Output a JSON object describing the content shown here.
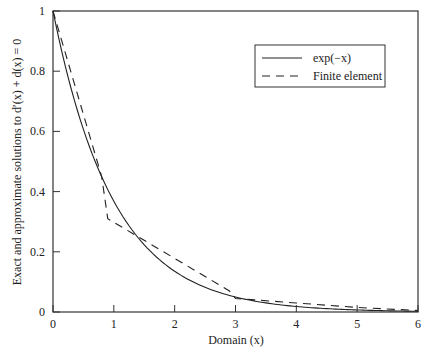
{
  "chart_data": {
    "type": "line",
    "title": "",
    "xlabel": "Domain (x)",
    "ylabel": "Exact and approximate solutions to d'(x) + d(x) = 0",
    "xlim": [
      0,
      6
    ],
    "ylim": [
      0,
      1
    ],
    "x_ticks": [
      "0",
      "1",
      "2",
      "3",
      "4",
      "5",
      "6"
    ],
    "y_ticks": [
      "0",
      "0.2",
      "0.4",
      "0.6",
      "0.8",
      "1"
    ],
    "grid": false,
    "legend_position": "upper right",
    "series": [
      {
        "name": "exp(−x)",
        "style": "solid",
        "x": [
          0,
          0.25,
          0.5,
          0.75,
          1,
          1.5,
          2,
          2.5,
          3,
          3.5,
          4,
          4.5,
          5,
          5.5,
          6
        ],
        "y": [
          1,
          0.779,
          0.607,
          0.472,
          0.368,
          0.223,
          0.135,
          0.082,
          0.05,
          0.03,
          0.018,
          0.011,
          0.007,
          0.004,
          0.002
        ]
      },
      {
        "name": "Finite element",
        "style": "dashed",
        "x": [
          0,
          0.8,
          0.9,
          2.9,
          3.0,
          4,
          5,
          6
        ],
        "y": [
          1,
          0.45,
          0.31,
          0.07,
          0.045,
          0.03,
          0.015,
          0.005
        ]
      }
    ]
  },
  "legend": {
    "items": [
      {
        "label": "exp(−x)",
        "style": "solid"
      },
      {
        "label": "Finite element",
        "style": "dashed"
      }
    ]
  },
  "axes": {
    "xlabel_text": "Domain (x)",
    "ylabel_text": "Exact and approximate solutions to d′(x) + d(x) = 0"
  }
}
